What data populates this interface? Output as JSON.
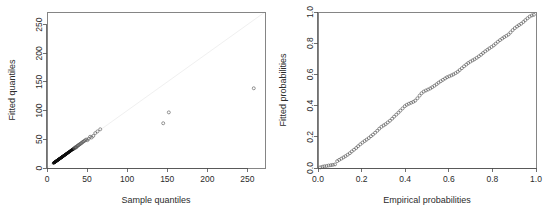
{
  "figure": {
    "title": "",
    "background_color": "#ffffff",
    "point_color": "#555555",
    "dense_point_color": "#0d0d0d",
    "reference_line_color": "#f0f0f0",
    "axis_color": "#4d4d4d"
  },
  "chart_data": [
    {
      "id": "qq-plot",
      "type": "scatter",
      "title": "",
      "xlabel": "Sample quantiles",
      "ylabel": "Fitted quantiles",
      "xlim": [
        0,
        272
      ],
      "ylim": [
        0,
        272
      ],
      "xticks": [
        0,
        50,
        100,
        150,
        200,
        250
      ],
      "yticks": [
        0,
        50,
        100,
        150,
        200,
        250
      ],
      "xticklabels": [
        "0",
        "50",
        "100",
        "150",
        "200",
        "250"
      ],
      "yticklabels": [
        "0",
        "50",
        "100",
        "150",
        "200",
        "250"
      ],
      "grid": false,
      "legend": null,
      "reference_line": {
        "type": "identity",
        "from": [
          0,
          0
        ],
        "to": [
          272,
          272
        ]
      },
      "marker": "open-circle",
      "points": [
        [
          8.0,
          8.5
        ],
        [
          8.6,
          9.0
        ],
        [
          9.0,
          9.4
        ],
        [
          9.4,
          9.8
        ],
        [
          9.7,
          10.1
        ],
        [
          10.0,
          10.4
        ],
        [
          10.3,
          10.7
        ],
        [
          10.6,
          11.0
        ],
        [
          10.9,
          11.3
        ],
        [
          11.2,
          11.6
        ],
        [
          11.5,
          11.9
        ],
        [
          11.8,
          12.2
        ],
        [
          12.0,
          12.4
        ],
        [
          12.3,
          12.7
        ],
        [
          12.6,
          13.0
        ],
        [
          12.9,
          13.3
        ],
        [
          13.2,
          13.6
        ],
        [
          13.5,
          13.9
        ],
        [
          13.8,
          14.2
        ],
        [
          14.0,
          14.4
        ],
        [
          14.3,
          14.7
        ],
        [
          14.6,
          15.0
        ],
        [
          14.9,
          15.3
        ],
        [
          15.2,
          15.6
        ],
        [
          15.5,
          15.9
        ],
        [
          15.8,
          16.2
        ],
        [
          16.1,
          16.5
        ],
        [
          16.4,
          16.8
        ],
        [
          16.7,
          17.1
        ],
        [
          17.0,
          17.4
        ],
        [
          17.3,
          17.7
        ],
        [
          17.6,
          18.0
        ],
        [
          17.9,
          18.3
        ],
        [
          18.2,
          18.6
        ],
        [
          18.5,
          18.9
        ],
        [
          18.8,
          19.2
        ],
        [
          19.1,
          19.5
        ],
        [
          19.4,
          19.8
        ],
        [
          19.7,
          20.1
        ],
        [
          20.0,
          20.4
        ],
        [
          20.4,
          20.8
        ],
        [
          20.8,
          21.2
        ],
        [
          21.1,
          21.5
        ],
        [
          21.5,
          21.9
        ],
        [
          21.9,
          22.3
        ],
        [
          22.3,
          22.7
        ],
        [
          22.7,
          23.1
        ],
        [
          23.1,
          23.5
        ],
        [
          23.5,
          23.9
        ],
        [
          23.9,
          24.3
        ],
        [
          24.3,
          24.7
        ],
        [
          24.7,
          25.1
        ],
        [
          25.1,
          25.5
        ],
        [
          25.5,
          26.0
        ],
        [
          26.0,
          26.4
        ],
        [
          26.4,
          26.9
        ],
        [
          26.9,
          27.3
        ],
        [
          27.3,
          27.8
        ],
        [
          27.8,
          28.2
        ],
        [
          28.3,
          28.7
        ],
        [
          28.8,
          29.2
        ],
        [
          29.3,
          29.7
        ],
        [
          29.8,
          30.3
        ],
        [
          30.3,
          30.8
        ],
        [
          30.9,
          31.3
        ],
        [
          31.4,
          31.9
        ],
        [
          32.0,
          32.5
        ],
        [
          32.6,
          33.1
        ],
        [
          33.2,
          33.7
        ],
        [
          33.5,
          33.3
        ],
        [
          34.0,
          34.4
        ],
        [
          34.6,
          35.1
        ],
        [
          35.3,
          35.8
        ],
        [
          36.0,
          36.5
        ],
        [
          36.5,
          35.9
        ],
        [
          37.4,
          37.9
        ],
        [
          38.2,
          38.7
        ],
        [
          39.0,
          39.5
        ],
        [
          39.9,
          40.4
        ],
        [
          40.8,
          41.3
        ],
        [
          41.8,
          42.4
        ],
        [
          42.8,
          43.4
        ],
        [
          43.9,
          44.5
        ],
        [
          45.0,
          45.7
        ],
        [
          46.2,
          46.9
        ],
        [
          47.5,
          48.2
        ],
        [
          48.9,
          49.6
        ],
        [
          50.4,
          48.5
        ],
        [
          52.0,
          51.0
        ],
        [
          53.8,
          54.5
        ],
        [
          55.7,
          53.2
        ],
        [
          57.8,
          56.0
        ],
        [
          60.2,
          60.8
        ],
        [
          63.0,
          63.8
        ],
        [
          66.4,
          67.5
        ],
        [
          145.0,
          78.0
        ],
        [
          152.0,
          97.0
        ],
        [
          258.0,
          139.0
        ]
      ]
    },
    {
      "id": "pp-plot",
      "type": "scatter",
      "title": "",
      "xlabel": "Empirical probabilities",
      "ylabel": "Fitted probabilities",
      "xlim": [
        0.0,
        1.0
      ],
      "ylim": [
        0.0,
        1.0
      ],
      "xticks": [
        0.0,
        0.2,
        0.4,
        0.6,
        0.8,
        1.0
      ],
      "yticks": [
        0.0,
        0.2,
        0.4,
        0.6,
        0.8,
        1.0
      ],
      "xticklabels": [
        "0.0",
        "0.2",
        "0.4",
        "0.6",
        "0.8",
        "1.0"
      ],
      "yticklabels": [
        "0.0",
        "0.2",
        "0.4",
        "0.6",
        "0.8",
        "1.0"
      ],
      "grid": false,
      "legend": null,
      "reference_line": null,
      "marker": "open-circle",
      "points": [
        [
          0.01,
          0.004
        ],
        [
          0.02,
          0.008
        ],
        [
          0.029,
          0.011
        ],
        [
          0.039,
          0.013
        ],
        [
          0.049,
          0.016
        ],
        [
          0.059,
          0.018
        ],
        [
          0.068,
          0.02
        ],
        [
          0.078,
          0.023
        ],
        [
          0.088,
          0.044
        ],
        [
          0.097,
          0.052
        ],
        [
          0.107,
          0.06
        ],
        [
          0.117,
          0.068
        ],
        [
          0.126,
          0.076
        ],
        [
          0.136,
          0.085
        ],
        [
          0.146,
          0.095
        ],
        [
          0.155,
          0.106
        ],
        [
          0.165,
          0.117
        ],
        [
          0.175,
          0.128
        ],
        [
          0.184,
          0.14
        ],
        [
          0.194,
          0.152
        ],
        [
          0.204,
          0.163
        ],
        [
          0.214,
          0.173
        ],
        [
          0.223,
          0.182
        ],
        [
          0.233,
          0.192
        ],
        [
          0.243,
          0.204
        ],
        [
          0.252,
          0.214
        ],
        [
          0.262,
          0.226
        ],
        [
          0.272,
          0.239
        ],
        [
          0.281,
          0.252
        ],
        [
          0.291,
          0.264
        ],
        [
          0.301,
          0.273
        ],
        [
          0.31,
          0.281
        ],
        [
          0.32,
          0.292
        ],
        [
          0.33,
          0.303
        ],
        [
          0.34,
          0.316
        ],
        [
          0.349,
          0.329
        ],
        [
          0.359,
          0.342
        ],
        [
          0.369,
          0.355
        ],
        [
          0.378,
          0.368
        ],
        [
          0.388,
          0.382
        ],
        [
          0.398,
          0.396
        ],
        [
          0.407,
          0.405
        ],
        [
          0.417,
          0.412
        ],
        [
          0.427,
          0.418
        ],
        [
          0.437,
          0.424
        ],
        [
          0.446,
          0.432
        ],
        [
          0.456,
          0.447
        ],
        [
          0.466,
          0.464
        ],
        [
          0.475,
          0.479
        ],
        [
          0.485,
          0.49
        ],
        [
          0.495,
          0.497
        ],
        [
          0.505,
          0.503
        ],
        [
          0.515,
          0.51
        ],
        [
          0.524,
          0.518
        ],
        [
          0.534,
          0.527
        ],
        [
          0.544,
          0.537
        ],
        [
          0.553,
          0.547
        ],
        [
          0.563,
          0.556
        ],
        [
          0.573,
          0.565
        ],
        [
          0.583,
          0.574
        ],
        [
          0.592,
          0.582
        ],
        [
          0.602,
          0.588
        ],
        [
          0.612,
          0.594
        ],
        [
          0.621,
          0.6
        ],
        [
          0.631,
          0.608
        ],
        [
          0.641,
          0.617
        ],
        [
          0.65,
          0.628
        ],
        [
          0.66,
          0.64
        ],
        [
          0.67,
          0.652
        ],
        [
          0.68,
          0.663
        ],
        [
          0.689,
          0.673
        ],
        [
          0.699,
          0.682
        ],
        [
          0.709,
          0.69
        ],
        [
          0.718,
          0.697
        ],
        [
          0.728,
          0.706
        ],
        [
          0.738,
          0.716
        ],
        [
          0.748,
          0.726
        ],
        [
          0.757,
          0.737
        ],
        [
          0.767,
          0.748
        ],
        [
          0.777,
          0.758
        ],
        [
          0.786,
          0.767
        ],
        [
          0.796,
          0.776
        ],
        [
          0.806,
          0.786
        ],
        [
          0.815,
          0.797
        ],
        [
          0.825,
          0.809
        ],
        [
          0.835,
          0.82
        ],
        [
          0.845,
          0.83
        ],
        [
          0.854,
          0.839
        ],
        [
          0.864,
          0.847
        ],
        [
          0.874,
          0.856
        ],
        [
          0.883,
          0.869
        ],
        [
          0.893,
          0.884
        ],
        [
          0.903,
          0.897
        ],
        [
          0.913,
          0.907
        ],
        [
          0.922,
          0.916
        ],
        [
          0.932,
          0.925
        ],
        [
          0.942,
          0.936
        ],
        [
          0.951,
          0.948
        ],
        [
          0.961,
          0.96
        ],
        [
          0.971,
          0.971
        ],
        [
          0.981,
          0.978
        ],
        [
          0.99,
          0.982
        ]
      ]
    }
  ]
}
